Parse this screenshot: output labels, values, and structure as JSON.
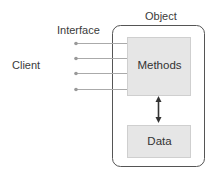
{
  "labels": {
    "object": "Object",
    "interface": "Interface",
    "client": "Client"
  },
  "boxes": {
    "methods": "Methods",
    "data": "Data"
  },
  "interface_ports": 4,
  "colors": {
    "box_fill": "#e6e6e6",
    "box_stroke": "#c8c8c8",
    "outer_stroke": "#555555",
    "line": "#aaaaaa",
    "dot": "#999999",
    "arrow": "#333333"
  }
}
